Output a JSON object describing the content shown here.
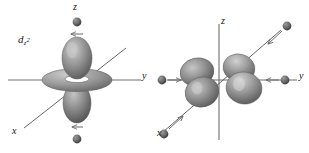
{
  "figure": {
    "background_color": "#ffffff",
    "width": 309,
    "height": 153,
    "style": "grayscale shaded 3D chemistry orbital illustration"
  },
  "colors": {
    "axis": "#6e6e6e",
    "axis_dark": "#3a3a3a",
    "arrow": "#6b6b6b",
    "ball_dark": "#555555",
    "ball_light": "#8f8f8f",
    "lobe_dark": "#6a6a6a",
    "lobe_mid": "#9a9a9a",
    "lobe_light": "#d8d8d8",
    "text": "#141414"
  },
  "panels": [
    {
      "id": "d-z-squared",
      "orbital_label_plain": "d z2",
      "orbital_label_parts": {
        "base": "d",
        "sub_main": "z",
        "sub_exp": "2"
      },
      "axes": [
        {
          "name": "z",
          "label": "z",
          "direction": "vertical",
          "label_position": "top"
        },
        {
          "name": "y",
          "label": "y",
          "direction": "horizontal",
          "label_position": "right"
        },
        {
          "name": "x",
          "label": "x",
          "direction": "diagonal",
          "label_position": "bottom-left"
        }
      ],
      "orbital_shape": "two vertical lobes along z plus an equatorial torus ring",
      "point_charges": [
        {
          "id": "charge-top",
          "position": "above on z axis",
          "arrow": "down",
          "arrow_direction": "toward-nucleus"
        },
        {
          "id": "charge-bottom",
          "position": "below on z axis",
          "arrow": "up",
          "arrow_direction": "toward-nucleus"
        }
      ]
    },
    {
      "id": "d-x-squared-minus-y-squared",
      "orbital_label_plain": "d x2-y2",
      "orbital_label_parts": {
        "base": "d",
        "sub_x": "x",
        "sub_x_exp": "2",
        "sub_minus": "-",
        "sub_y": "y",
        "sub_y_exp": "2"
      },
      "axes": [
        {
          "name": "z",
          "label": "z",
          "direction": "vertical",
          "label_position": "top"
        },
        {
          "name": "y",
          "label": "y",
          "direction": "horizontal",
          "label_position": "right"
        },
        {
          "name": "x",
          "label": "x",
          "direction": "diagonal",
          "label_position": "bottom-left"
        }
      ],
      "orbital_shape": "four lobes in the xy plane pointing along x and y axes",
      "point_charges": [
        {
          "id": "charge-left",
          "position": "left on y axis",
          "arrow": "right",
          "arrow_direction": "toward-nucleus"
        },
        {
          "id": "charge-right",
          "position": "right on y axis",
          "arrow": "left",
          "arrow_direction": "toward-nucleus"
        },
        {
          "id": "charge-upper-right",
          "position": "upper right on x axis",
          "arrow": "down-left",
          "arrow_direction": "toward-nucleus"
        },
        {
          "id": "charge-lower-left",
          "position": "lower left on x axis",
          "arrow": "up-right",
          "arrow_direction": "toward-nucleus"
        }
      ]
    }
  ]
}
